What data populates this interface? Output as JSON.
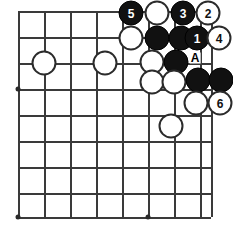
{
  "figure": {
    "kind": "go-board-diagram",
    "width": 233,
    "height": 231,
    "background_color": "#ffffff",
    "line_color": "#3a3a3a",
    "black_stone_color": "#111111",
    "white_stone_color": "#ffffff",
    "stone_outline_color": "#2b2b2b"
  },
  "board": {
    "origin_x": 18,
    "origin_y": 11,
    "spacing": 26,
    "columns": 8,
    "rows": 9,
    "stone_diameter": 25,
    "vertical_lines_x": [
      18,
      44,
      70,
      96,
      122,
      148,
      174,
      200
    ],
    "horizontal_lines_y": [
      11,
      37,
      63,
      89,
      115,
      141,
      167,
      193,
      217
    ],
    "right_edge_x": 211,
    "star_points": [
      {
        "name": "star-point-left",
        "x": 18,
        "y": 89
      },
      {
        "name": "star-point-bottom-left",
        "x": 18,
        "y": 217
      },
      {
        "name": "star-point-bottom-center",
        "x": 148,
        "y": 217
      }
    ]
  },
  "stones": [
    {
      "id": "stone-5",
      "color": "black",
      "label": "5",
      "x": 131,
      "y": 13
    },
    {
      "id": "stone-w-top-1",
      "color": "white",
      "label": "",
      "x": 157,
      "y": 13
    },
    {
      "id": "stone-3",
      "color": "black",
      "label": "3",
      "x": 183,
      "y": 13
    },
    {
      "id": "stone-2",
      "color": "white",
      "label": "2",
      "x": 208,
      "y": 13
    },
    {
      "id": "stone-w-r2-1",
      "color": "white",
      "label": "",
      "x": 131,
      "y": 38
    },
    {
      "id": "stone-b-r2-1",
      "color": "black",
      "label": "",
      "x": 157,
      "y": 38
    },
    {
      "id": "stone-b-r2-2",
      "color": "black",
      "label": "",
      "x": 181,
      "y": 38
    },
    {
      "id": "stone-1",
      "color": "black",
      "label": "1",
      "x": 197,
      "y": 38
    },
    {
      "id": "stone-4",
      "color": "white",
      "label": "4",
      "x": 219,
      "y": 38
    },
    {
      "id": "stone-w-left-1",
      "color": "white",
      "label": "",
      "x": 44,
      "y": 63
    },
    {
      "id": "stone-w-left-2",
      "color": "white",
      "label": "",
      "x": 105,
      "y": 63
    },
    {
      "id": "stone-w-r3-1",
      "color": "white",
      "label": "",
      "x": 152,
      "y": 62
    },
    {
      "id": "stone-b-r3-1",
      "color": "black",
      "label": "",
      "x": 176,
      "y": 62
    },
    {
      "id": "stone-w-r4-1",
      "color": "white",
      "label": "",
      "x": 152,
      "y": 82
    },
    {
      "id": "stone-w-r4-2",
      "color": "white",
      "label": "",
      "x": 174,
      "y": 82
    },
    {
      "id": "stone-b-r4-1",
      "color": "black",
      "label": "",
      "x": 198,
      "y": 80
    },
    {
      "id": "stone-b-r4-2",
      "color": "black",
      "label": "",
      "x": 221,
      "y": 80
    },
    {
      "id": "stone-w-r5-1",
      "color": "white",
      "label": "",
      "x": 196,
      "y": 103
    },
    {
      "id": "stone-6",
      "color": "white",
      "label": "6",
      "x": 220,
      "y": 103
    },
    {
      "id": "stone-w-bottom-1",
      "color": "white",
      "label": "",
      "x": 171,
      "y": 126
    }
  ],
  "markers": [
    {
      "id": "marker-a",
      "label": "A",
      "x": 195,
      "y": 58
    }
  ]
}
